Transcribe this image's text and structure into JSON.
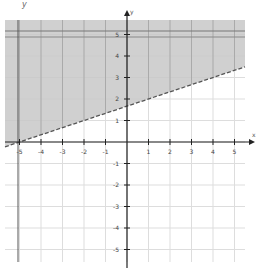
{
  "chart_data": {
    "type": "inequality-graph",
    "title": "",
    "xlabel": "x",
    "ylabel": "y",
    "xlim": [
      -5.5,
      5.5
    ],
    "ylim": [
      -5.5,
      5.5
    ],
    "x_ticks": [
      -5,
      -4,
      -3,
      -2,
      -1,
      1,
      2,
      3,
      4,
      5
    ],
    "y_ticks": [
      -5,
      -4,
      -3,
      -2,
      -1,
      1,
      2,
      3,
      4,
      5
    ],
    "grid": true,
    "boundary_line": {
      "style": "dashed",
      "slope": 0.3333,
      "intercept": 1.6667,
      "points": [
        [
          -5,
          0
        ],
        [
          1,
          2
        ],
        [
          4,
          3
        ]
      ],
      "equation": "y = (1/3)x + 5/3"
    },
    "shaded_region": "above",
    "inequality": "y > (1/3)x + 5/3",
    "shade_color": "#c8c8c8",
    "axis_color": "#222222",
    "grid_color": "#dddddd"
  },
  "labels": {
    "corner": "y",
    "x_axis": "x",
    "y_axis": "y"
  }
}
